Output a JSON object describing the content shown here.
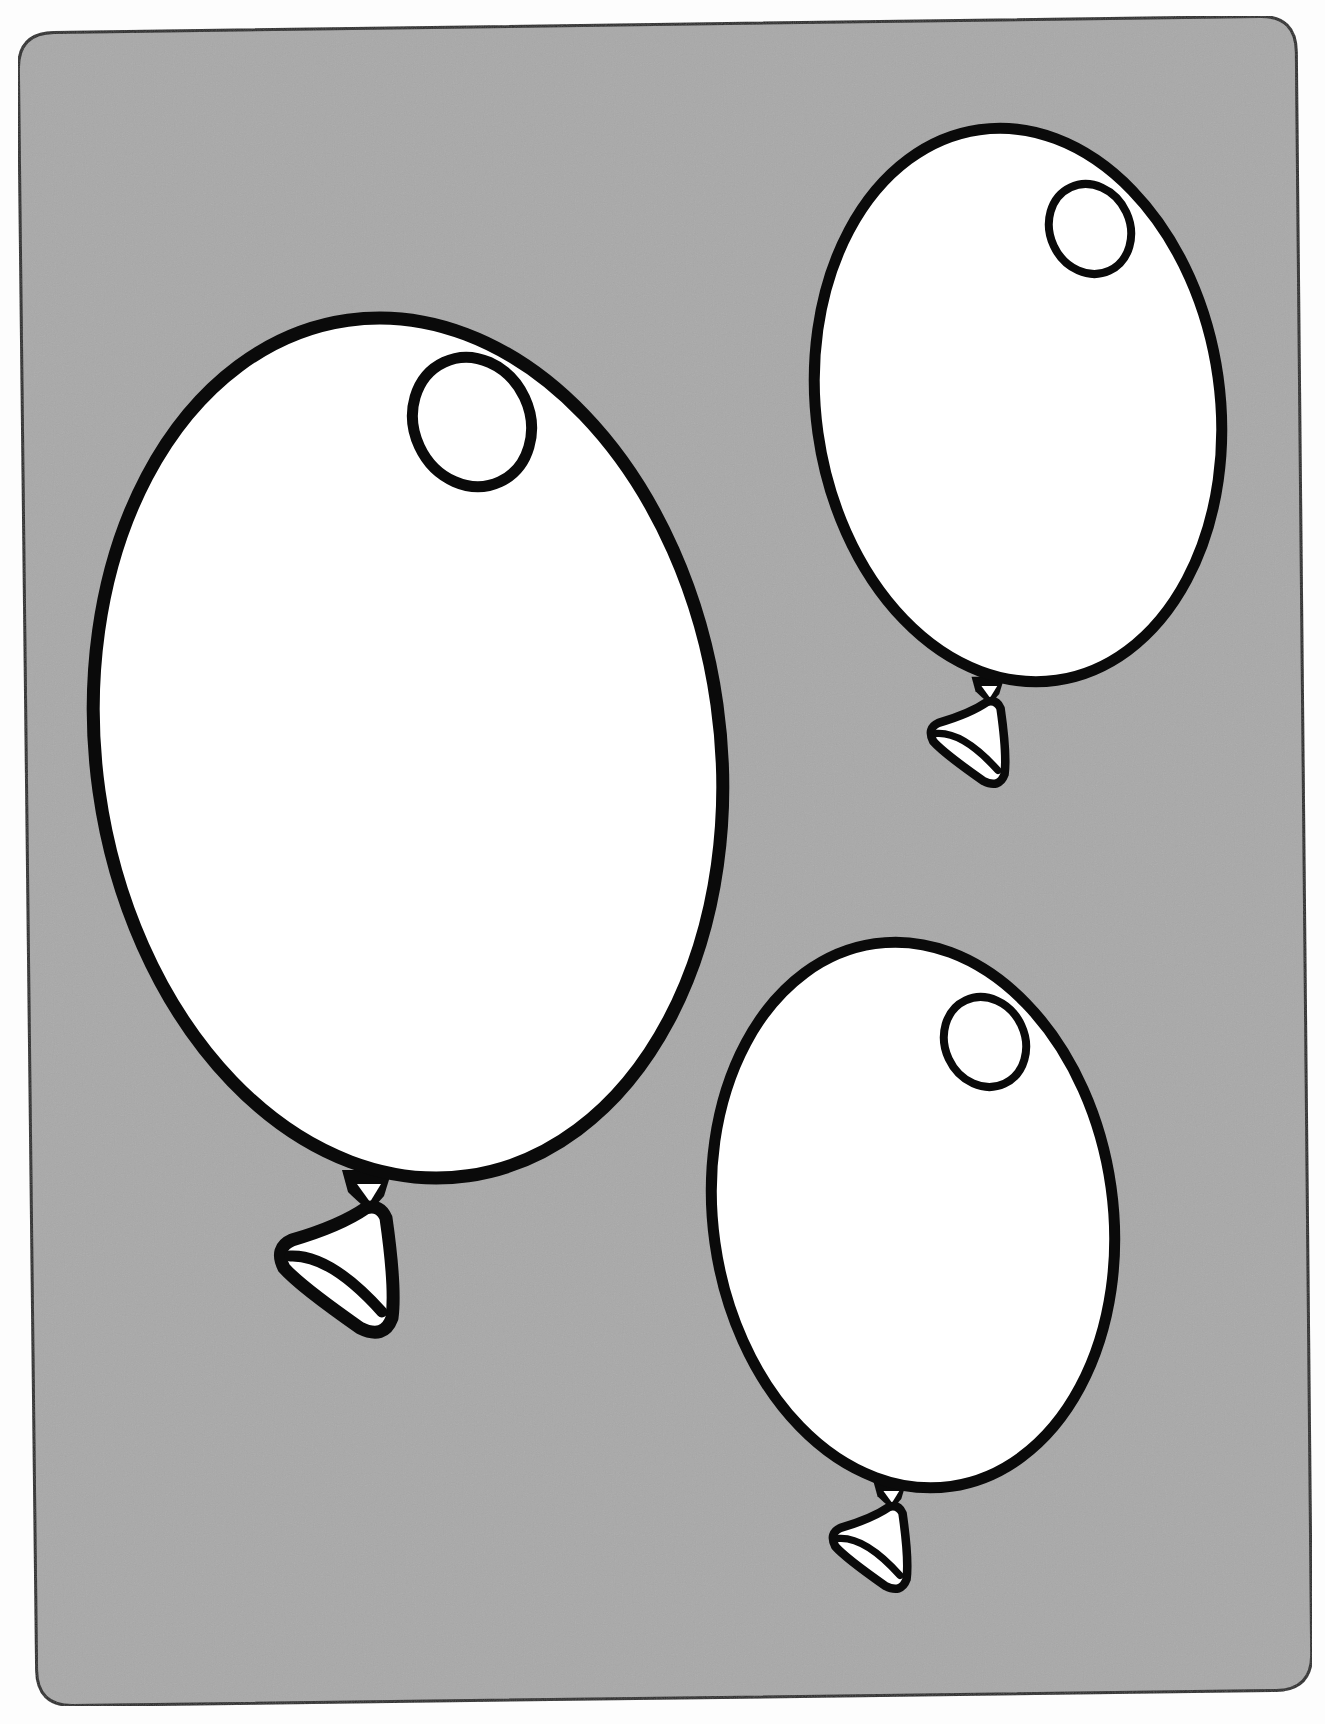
{
  "page": {
    "title": "Balloons coloring page"
  },
  "colors": {
    "page_background": "#fdfdfd",
    "panel_fill": "#a9a9a9",
    "panel_stroke": "#2a2a2a",
    "outline": "#0a0a0a",
    "balloon_fill": "#ffffff"
  },
  "panel": {
    "corners": [
      [
        18,
        33
      ],
      [
        1296,
        16
      ],
      [
        1312,
        1690
      ],
      [
        37,
        1706
      ]
    ],
    "corner_radius": 36
  },
  "balloons": [
    {
      "id": "large-balloon",
      "label": "Large balloon",
      "cx": 408,
      "cy": 748,
      "rx": 312,
      "ry": 432,
      "rotate": -8,
      "highlight": {
        "cx": 472,
        "cy": 422,
        "rx": 58,
        "ry": 66,
        "rotate": -25
      },
      "knot": {
        "x": 370,
        "y": 1178,
        "scale": 1.0
      }
    },
    {
      "id": "top-right-balloon",
      "label": "Top-right balloon",
      "cx": 1018,
      "cy": 405,
      "rx": 202,
      "ry": 278,
      "rotate": -8,
      "highlight": {
        "cx": 1090,
        "cy": 229,
        "rx": 40,
        "ry": 46,
        "rotate": -25
      },
      "knot": {
        "x": 990,
        "y": 682,
        "scale": 0.66
      }
    },
    {
      "id": "bottom-balloon",
      "label": "Bottom balloon",
      "cx": 913,
      "cy": 1215,
      "rx": 200,
      "ry": 274,
      "rotate": -8,
      "highlight": {
        "cx": 985,
        "cy": 1042,
        "rx": 40,
        "ry": 46,
        "rotate": -25
      },
      "knot": {
        "x": 892,
        "y": 1487,
        "scale": 0.66
      }
    }
  ]
}
